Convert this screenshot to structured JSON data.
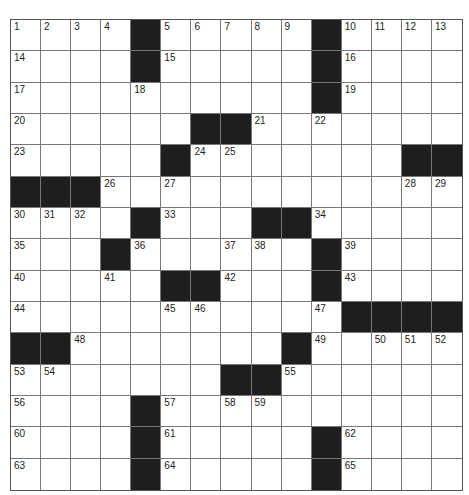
{
  "puzzle": {
    "rows": 15,
    "cols": 15,
    "colors": {
      "black": "#1e1e1e",
      "white": "#ffffff",
      "line": "#777777"
    },
    "grid": [
      "....#.....#....",
      "....#.....#....",
      "..........#....",
      "......##.......",
      ".....#.......##",
      "###............",
      "....#...##.....",
      "...#......#....",
      ".....##...#....",
      "...........####",
      "##.......#.....",
      ".......##......",
      "....#..........",
      "....#.....#....",
      "....#.....#...."
    ],
    "numbers": [
      {
        "r": 0,
        "c": 0,
        "n": "1"
      },
      {
        "r": 0,
        "c": 1,
        "n": "2"
      },
      {
        "r": 0,
        "c": 2,
        "n": "3"
      },
      {
        "r": 0,
        "c": 3,
        "n": "4"
      },
      {
        "r": 0,
        "c": 5,
        "n": "5"
      },
      {
        "r": 0,
        "c": 6,
        "n": "6"
      },
      {
        "r": 0,
        "c": 7,
        "n": "7"
      },
      {
        "r": 0,
        "c": 8,
        "n": "8"
      },
      {
        "r": 0,
        "c": 9,
        "n": "9"
      },
      {
        "r": 0,
        "c": 11,
        "n": "10"
      },
      {
        "r": 0,
        "c": 12,
        "n": "11"
      },
      {
        "r": 0,
        "c": 13,
        "n": "12"
      },
      {
        "r": 0,
        "c": 14,
        "n": "13"
      },
      {
        "r": 1,
        "c": 0,
        "n": "14"
      },
      {
        "r": 1,
        "c": 5,
        "n": "15"
      },
      {
        "r": 1,
        "c": 11,
        "n": "16"
      },
      {
        "r": 2,
        "c": 0,
        "n": "17"
      },
      {
        "r": 2,
        "c": 4,
        "n": "18"
      },
      {
        "r": 2,
        "c": 11,
        "n": "19"
      },
      {
        "r": 3,
        "c": 0,
        "n": "20"
      },
      {
        "r": 3,
        "c": 8,
        "n": "21"
      },
      {
        "r": 3,
        "c": 10,
        "n": "22"
      },
      {
        "r": 4,
        "c": 0,
        "n": "23"
      },
      {
        "r": 4,
        "c": 6,
        "n": "24"
      },
      {
        "r": 4,
        "c": 7,
        "n": "25"
      },
      {
        "r": 5,
        "c": 3,
        "n": "26"
      },
      {
        "r": 5,
        "c": 5,
        "n": "27"
      },
      {
        "r": 5,
        "c": 13,
        "n": "28"
      },
      {
        "r": 5,
        "c": 14,
        "n": "29"
      },
      {
        "r": 6,
        "c": 0,
        "n": "30"
      },
      {
        "r": 6,
        "c": 1,
        "n": "31"
      },
      {
        "r": 6,
        "c": 2,
        "n": "32"
      },
      {
        "r": 6,
        "c": 5,
        "n": "33"
      },
      {
        "r": 6,
        "c": 10,
        "n": "34"
      },
      {
        "r": 7,
        "c": 0,
        "n": "35"
      },
      {
        "r": 7,
        "c": 4,
        "n": "36"
      },
      {
        "r": 7,
        "c": 7,
        "n": "37"
      },
      {
        "r": 7,
        "c": 8,
        "n": "38"
      },
      {
        "r": 7,
        "c": 11,
        "n": "39"
      },
      {
        "r": 8,
        "c": 0,
        "n": "40"
      },
      {
        "r": 8,
        "c": 3,
        "n": "41"
      },
      {
        "r": 8,
        "c": 7,
        "n": "42"
      },
      {
        "r": 8,
        "c": 11,
        "n": "43"
      },
      {
        "r": 9,
        "c": 0,
        "n": "44"
      },
      {
        "r": 9,
        "c": 5,
        "n": "45"
      },
      {
        "r": 9,
        "c": 6,
        "n": "46"
      },
      {
        "r": 9,
        "c": 10,
        "n": "47"
      },
      {
        "r": 10,
        "c": 2,
        "n": "48"
      },
      {
        "r": 10,
        "c": 10,
        "n": "49"
      },
      {
        "r": 10,
        "c": 12,
        "n": "50"
      },
      {
        "r": 10,
        "c": 13,
        "n": "51"
      },
      {
        "r": 10,
        "c": 14,
        "n": "52"
      },
      {
        "r": 11,
        "c": 0,
        "n": "53"
      },
      {
        "r": 11,
        "c": 1,
        "n": "54"
      },
      {
        "r": 11,
        "c": 9,
        "n": "55"
      },
      {
        "r": 12,
        "c": 0,
        "n": "56"
      },
      {
        "r": 12,
        "c": 5,
        "n": "57"
      },
      {
        "r": 12,
        "c": 7,
        "n": "58"
      },
      {
        "r": 12,
        "c": 8,
        "n": "59"
      },
      {
        "r": 13,
        "c": 0,
        "n": "60"
      },
      {
        "r": 13,
        "c": 5,
        "n": "61"
      },
      {
        "r": 13,
        "c": 11,
        "n": "62"
      },
      {
        "r": 14,
        "c": 0,
        "n": "63"
      },
      {
        "r": 14,
        "c": 5,
        "n": "64"
      },
      {
        "r": 14,
        "c": 11,
        "n": "65"
      }
    ]
  }
}
